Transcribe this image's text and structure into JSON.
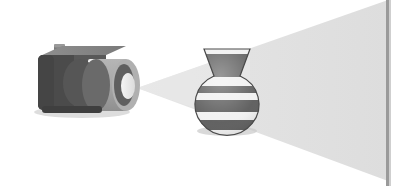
{
  "scene": {
    "title": "Projector light cone with striped vase",
    "width": 408,
    "height": 186,
    "background_color": "#ffffff"
  },
  "colors": {
    "background": "#ffffff",
    "beam_fill": "#e0e0e0",
    "beam_fill_far": "#dcdcdc",
    "screen_line": "#9a9a9a",
    "projector_body_dark": "#4a4a4a",
    "projector_body_front": "#5d5d5d",
    "projector_body_top": "#8c8c8c",
    "projector_body_side": "#6e6e6e",
    "lens_barrel": "#a8a8a8",
    "lens_barrel_shade": "#949494",
    "lens_ring_dark": "#4f4f4f",
    "lens_glow": "#d8d8d8",
    "knob": "#7b7b7b",
    "highlight_strip": "#f2f2f2",
    "vase_dark": "#5a5a5a",
    "vase_light": "#f0f0f0",
    "vase_outline": "#4a4a4a",
    "shadow": "#c9c9c9"
  },
  "projector": {
    "label": "projector",
    "body": {
      "x": 36,
      "y": 52,
      "width": 78,
      "height": 58
    },
    "knob": {
      "x": 54,
      "y": 44,
      "width": 11,
      "height": 10
    },
    "lens_barrel": {
      "cx": 125,
      "cy": 85,
      "rx": 14,
      "ry": 26
    },
    "top_highlight": {
      "x": 88,
      "y": 60,
      "width": 24,
      "height": 6
    },
    "apex": {
      "x": 137,
      "y": 88
    }
  },
  "beam": {
    "label": "light-cone",
    "apex_x": 137,
    "apex_y": 88,
    "top_end_x": 388,
    "top_end_y": 0,
    "bottom_end_x": 388,
    "bottom_end_y": 181,
    "opacity": 1
  },
  "screen": {
    "label": "projection-screen-edge",
    "x": 388,
    "y_top": 0,
    "y_bottom": 186,
    "thickness": 3
  },
  "vase": {
    "label": "striped-vase",
    "center_x": 227,
    "top_y": 49,
    "bottom_y": 130,
    "body_cx": 227,
    "body_cy": 100,
    "body_rx": 32,
    "body_ry": 31,
    "neck_top_half_width": 23,
    "neck_bottom_half_width": 13,
    "neck_top_y": 49,
    "neck_bottom_y": 76,
    "stripes": [
      {
        "name": "rim",
        "from_y": 49,
        "to_y": 54,
        "color": "dark"
      },
      {
        "name": "neck",
        "from_y": 54,
        "to_y": 77,
        "color": "dark"
      },
      {
        "name": "shoulder-light",
        "from_y": 77,
        "to_y": 86,
        "color": "light"
      },
      {
        "name": "upper-dark",
        "from_y": 86,
        "to_y": 93,
        "color": "dark"
      },
      {
        "name": "mid-light",
        "from_y": 93,
        "to_y": 100,
        "color": "light"
      },
      {
        "name": "mid-dark",
        "from_y": 100,
        "to_y": 112,
        "color": "dark"
      },
      {
        "name": "lower-light",
        "from_y": 112,
        "to_y": 120,
        "color": "light"
      },
      {
        "name": "base-dark",
        "from_y": 120,
        "to_y": 130,
        "color": "dark"
      }
    ]
  },
  "shadow": {
    "label": "vase-shadow",
    "cx": 227,
    "cy": 131,
    "rx": 30,
    "ry": 5
  }
}
